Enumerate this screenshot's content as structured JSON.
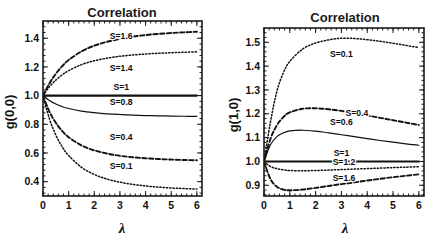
{
  "figure": {
    "caption": "Two correlation function plots versus lambda for several values of S"
  },
  "chart_data": [
    {
      "panel": "left",
      "type": "line",
      "title": "Correlation",
      "xlabel": "λ",
      "ylabel": "g(0,0)",
      "xlim": [
        0,
        6.2
      ],
      "ylim": [
        0.3,
        1.52
      ],
      "xticks": [
        "0",
        "1",
        "2",
        "3",
        "4",
        "5",
        "6"
      ],
      "xtick_values": [
        0,
        1,
        2,
        3,
        4,
        5,
        6
      ],
      "yticks": [
        "0.4",
        "0.6",
        "0.8",
        "1.0",
        "1.2",
        "1.4"
      ],
      "ytick_values": [
        0.4,
        0.6,
        0.8,
        1.0,
        1.2,
        1.4
      ],
      "grid": false,
      "legend_position": "inline-labels",
      "x": [
        0,
        0.25,
        0.5,
        0.75,
        1,
        1.5,
        2,
        2.5,
        3,
        3.5,
        4,
        4.5,
        5,
        5.5,
        6
      ],
      "series": [
        {
          "name": "S=1.6",
          "label": "S=1.6",
          "style": "dashed",
          "label_x": 3.05,
          "label_y": 1.395,
          "values": [
            1.0,
            1.085,
            1.152,
            1.205,
            1.248,
            1.308,
            1.348,
            1.375,
            1.395,
            1.411,
            1.422,
            1.43,
            1.436,
            1.441,
            1.445
          ]
        },
        {
          "name": "S=1.4",
          "label": "S=1.4",
          "style": "dotted",
          "label_x": 3.05,
          "label_y": 1.173,
          "values": [
            1.0,
            1.062,
            1.108,
            1.145,
            1.174,
            1.216,
            1.243,
            1.261,
            1.274,
            1.283,
            1.29,
            1.295,
            1.299,
            1.302,
            1.305
          ]
        },
        {
          "name": "S=1",
          "label": "S=1",
          "style": "solid-thick",
          "label_x": 3.05,
          "label_y": 1.042,
          "values": [
            1.0,
            1.0,
            1.0,
            1.0,
            1.0,
            1.0,
            1.0,
            1.0,
            1.0,
            1.0,
            1.0,
            1.0,
            1.0,
            1.0,
            1.0
          ]
        },
        {
          "name": "S=0.8",
          "label": "S=0.8",
          "style": "solid",
          "label_x": 3.05,
          "label_y": 0.932,
          "values": [
            1.0,
            0.965,
            0.941,
            0.923,
            0.91,
            0.892,
            0.881,
            0.873,
            0.868,
            0.864,
            0.861,
            0.859,
            0.857,
            0.856,
            0.855
          ]
        },
        {
          "name": "S=0.4",
          "label": "S=0.4",
          "style": "dashed",
          "label_x": 3.05,
          "label_y": 0.69,
          "values": [
            1.0,
            0.888,
            0.81,
            0.753,
            0.71,
            0.653,
            0.618,
            0.596,
            0.58,
            0.57,
            0.563,
            0.558,
            0.554,
            0.551,
            0.549
          ]
        },
        {
          "name": "S=0.1",
          "label": "S=0.1",
          "style": "dotted",
          "label_x": 3.05,
          "label_y": 0.487,
          "values": [
            1.0,
            0.838,
            0.725,
            0.643,
            0.582,
            0.5,
            0.45,
            0.418,
            0.396,
            0.381,
            0.37,
            0.362,
            0.356,
            0.352,
            0.348
          ]
        }
      ]
    },
    {
      "panel": "right",
      "type": "line",
      "title": "Correlation",
      "xlabel": "λ",
      "ylabel": "g(1,0)",
      "xlim": [
        0,
        6.2
      ],
      "ylim": [
        0.855,
        1.56
      ],
      "xticks": [
        "0",
        "1",
        "2",
        "3",
        "4",
        "5",
        "6"
      ],
      "xtick_values": [
        0,
        1,
        2,
        3,
        4,
        5,
        6
      ],
      "yticks": [
        "0.9",
        "1.0",
        "1.1",
        "1.2",
        "1.3",
        "1.4",
        "1.5"
      ],
      "ytick_values": [
        0.9,
        1.0,
        1.1,
        1.2,
        1.3,
        1.4,
        1.5
      ],
      "grid": false,
      "legend_position": "inline-labels",
      "x": [
        0,
        0.25,
        0.5,
        0.75,
        1,
        1.5,
        2,
        2.5,
        3,
        3.5,
        4,
        4.5,
        5,
        5.5,
        6
      ],
      "series": [
        {
          "name": "S=0.1",
          "label": "S=0.1",
          "style": "dotted",
          "label_x": 3.0,
          "label_y": 1.44,
          "values": [
            1.0,
            1.165,
            1.295,
            1.372,
            1.42,
            1.472,
            1.497,
            1.51,
            1.517,
            1.516,
            1.511,
            1.504,
            1.496,
            1.487,
            1.478
          ]
        },
        {
          "name": "S=0.4",
          "label": "S=0.4",
          "style": "dashed",
          "label_x": 3.6,
          "label_y": 1.192,
          "values": [
            1.0,
            1.095,
            1.152,
            1.186,
            1.206,
            1.221,
            1.223,
            1.219,
            1.212,
            1.203,
            1.193,
            1.183,
            1.173,
            1.163,
            1.153
          ]
        },
        {
          "name": "S=0.6",
          "label": "S=0.6",
          "style": "solid",
          "label_x": 3.0,
          "label_y": 1.152,
          "values": [
            1.0,
            1.07,
            1.104,
            1.12,
            1.128,
            1.131,
            1.127,
            1.12,
            1.112,
            1.104,
            1.096,
            1.088,
            1.081,
            1.074,
            1.068
          ]
        },
        {
          "name": "S=1",
          "label": "S=1",
          "style": "solid-thick",
          "label_x": 3.0,
          "label_y": 1.022,
          "values": [
            1.0,
            1.0,
            1.0,
            1.0,
            1.0,
            1.0,
            1.0,
            1.0,
            1.0,
            1.0,
            1.0,
            1.0,
            1.0,
            1.0,
            1.0
          ]
        },
        {
          "name": "S=1.2",
          "label": "S=1.2",
          "style": "dotted",
          "label_x": 3.1,
          "label_y": 0.983,
          "values": [
            1.0,
            0.979,
            0.97,
            0.965,
            0.962,
            0.961,
            0.962,
            0.964,
            0.966,
            0.968,
            0.97,
            0.972,
            0.974,
            0.976,
            0.978
          ]
        },
        {
          "name": "S=1.6",
          "label": "S=1.6",
          "style": "dashed",
          "label_x": 3.1,
          "label_y": 0.917,
          "values": [
            1.0,
            0.926,
            0.894,
            0.882,
            0.879,
            0.882,
            0.889,
            0.897,
            0.905,
            0.912,
            0.92,
            0.927,
            0.934,
            0.94,
            0.946
          ]
        }
      ]
    }
  ]
}
